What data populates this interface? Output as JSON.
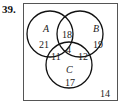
{
  "problem_number": "39.",
  "venn": {
    "sets": [
      {
        "name": "A",
        "only": "21"
      },
      {
        "name": "B",
        "only": "19"
      },
      {
        "name": "C",
        "only": "17"
      }
    ],
    "regions": {
      "A_and_B_only": "18",
      "A_and_C_only": "11",
      "B_and_C_only": "12",
      "A_B_C": "4",
      "outside": "14"
    }
  }
}
